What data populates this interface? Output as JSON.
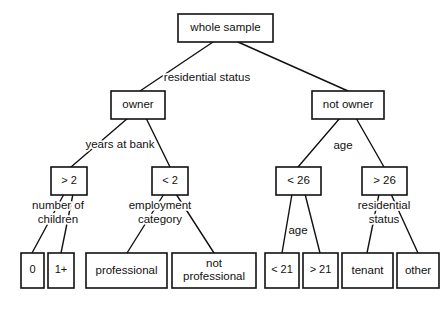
{
  "diagram": {
    "type": "decision-tree",
    "canvas": {
      "width": 447,
      "height": 311
    },
    "stroke_color": "#111111",
    "fill_color": "#ffffff",
    "nodes": [
      {
        "id": "root",
        "label": "whole sample",
        "x": 178,
        "y": 14,
        "w": 95,
        "h": 28,
        "lines": [
          "whole sample"
        ]
      },
      {
        "id": "owner",
        "label": "owner",
        "x": 111,
        "y": 91,
        "w": 54,
        "h": 28,
        "lines": [
          "owner"
        ]
      },
      {
        "id": "not-owner",
        "label": "not owner",
        "x": 312,
        "y": 91,
        "w": 72,
        "h": 28,
        "lines": [
          "not owner"
        ]
      },
      {
        "id": "gt2",
        "label": "> 2",
        "x": 51,
        "y": 167,
        "w": 36,
        "h": 28,
        "lines": [
          "> 2"
        ]
      },
      {
        "id": "lt2",
        "label": "< 2",
        "x": 152,
        "y": 167,
        "w": 36,
        "h": 28,
        "lines": [
          "< 2"
        ]
      },
      {
        "id": "lt26",
        "label": "< 26",
        "x": 276,
        "y": 167,
        "w": 45,
        "h": 28,
        "lines": [
          "< 26"
        ]
      },
      {
        "id": "gt26",
        "label": "> 26",
        "x": 362,
        "y": 167,
        "w": 45,
        "h": 28,
        "lines": [
          "> 26"
        ]
      },
      {
        "id": "children-0",
        "label": "0",
        "x": 21,
        "y": 253,
        "w": 23,
        "h": 35,
        "lines": [
          "0"
        ]
      },
      {
        "id": "children-1plus",
        "label": "1+",
        "x": 48,
        "y": 253,
        "w": 26,
        "h": 35,
        "lines": [
          "1+"
        ]
      },
      {
        "id": "professional",
        "label": "professional",
        "x": 86,
        "y": 253,
        "w": 81,
        "h": 35,
        "lines": [
          "professional"
        ]
      },
      {
        "id": "not-professional",
        "label": "not professional",
        "x": 172,
        "y": 253,
        "w": 84,
        "h": 35,
        "lines": [
          "not",
          "professional"
        ]
      },
      {
        "id": "lt21",
        "label": "< 21",
        "x": 265,
        "y": 253,
        "w": 34,
        "h": 35,
        "lines": [
          "< 21"
        ]
      },
      {
        "id": "gt21",
        "label": "> 21",
        "x": 303,
        "y": 253,
        "w": 35,
        "h": 35,
        "lines": [
          "> 21"
        ]
      },
      {
        "id": "tenant",
        "label": "tenant",
        "x": 342,
        "y": 253,
        "w": 51,
        "h": 35,
        "lines": [
          "tenant"
        ]
      },
      {
        "id": "other",
        "label": "other",
        "x": 397,
        "y": 253,
        "w": 42,
        "h": 35,
        "lines": [
          "other"
        ]
      }
    ],
    "edges": [
      {
        "id": "root-owner",
        "from": "root",
        "to": "owner",
        "x1": 213,
        "y1": 42,
        "x2": 140,
        "y2": 91
      },
      {
        "id": "root-not-owner",
        "from": "root",
        "to": "not-owner",
        "x1": 238,
        "y1": 42,
        "x2": 348,
        "y2": 91
      },
      {
        "id": "owner-gt2",
        "from": "owner",
        "to": "gt2",
        "x1": 128,
        "y1": 118,
        "x2": 71,
        "y2": 167
      },
      {
        "id": "owner-lt2",
        "from": "owner",
        "to": "lt2",
        "x1": 146,
        "y1": 118,
        "x2": 170,
        "y2": 167
      },
      {
        "id": "not-owner-lt26",
        "from": "not-owner",
        "to": "lt26",
        "x1": 340,
        "y1": 118,
        "x2": 298,
        "y2": 167
      },
      {
        "id": "not-owner-gt26",
        "from": "not-owner",
        "to": "gt26",
        "x1": 356,
        "y1": 118,
        "x2": 384,
        "y2": 167
      },
      {
        "id": "gt2-children-0",
        "from": "gt2",
        "to": "children-0",
        "x1": 64,
        "y1": 194,
        "x2": 32,
        "y2": 253
      },
      {
        "id": "gt2-children-1plus",
        "from": "gt2",
        "to": "children-1plus",
        "x1": 73,
        "y1": 194,
        "x2": 61,
        "y2": 253
      },
      {
        "id": "lt2-professional",
        "from": "lt2",
        "to": "professional",
        "x1": 164,
        "y1": 194,
        "x2": 127,
        "y2": 253
      },
      {
        "id": "lt2-not-professional",
        "from": "lt2",
        "to": "not-professional",
        "x1": 176,
        "y1": 194,
        "x2": 214,
        "y2": 253
      },
      {
        "id": "lt26-lt21",
        "from": "lt26",
        "to": "lt21",
        "x1": 292,
        "y1": 194,
        "x2": 282,
        "y2": 253
      },
      {
        "id": "lt26-gt21",
        "from": "lt26",
        "to": "gt21",
        "x1": 305,
        "y1": 194,
        "x2": 320,
        "y2": 253
      },
      {
        "id": "gt26-tenant",
        "from": "gt26",
        "to": "tenant",
        "x1": 379,
        "y1": 194,
        "x2": 367,
        "y2": 253
      },
      {
        "id": "gt26-other",
        "from": "gt26",
        "to": "other",
        "x1": 391,
        "y1": 194,
        "x2": 418,
        "y2": 253
      }
    ],
    "split_labels": [
      {
        "id": "split-root",
        "parent": "root",
        "x": 207,
        "y": 78,
        "lines": [
          "residential status"
        ]
      },
      {
        "id": "split-owner",
        "parent": "owner",
        "x": 120,
        "y": 145,
        "lines": [
          "years at bank"
        ]
      },
      {
        "id": "split-not-owner",
        "parent": "not-owner",
        "x": 343,
        "y": 146,
        "lines": [
          "age"
        ]
      },
      {
        "id": "split-gt2",
        "parent": "gt2",
        "x": 58,
        "y": 213,
        "lines": [
          "number of",
          "children"
        ]
      },
      {
        "id": "split-lt2",
        "parent": "lt2",
        "x": 160,
        "y": 213,
        "lines": [
          "employment",
          "category"
        ]
      },
      {
        "id": "split-lt26",
        "parent": "lt26",
        "x": 298,
        "y": 231,
        "lines": [
          "age"
        ]
      },
      {
        "id": "split-gt26",
        "parent": "gt26",
        "x": 384,
        "y": 213,
        "lines": [
          "residential",
          "status"
        ]
      }
    ]
  }
}
